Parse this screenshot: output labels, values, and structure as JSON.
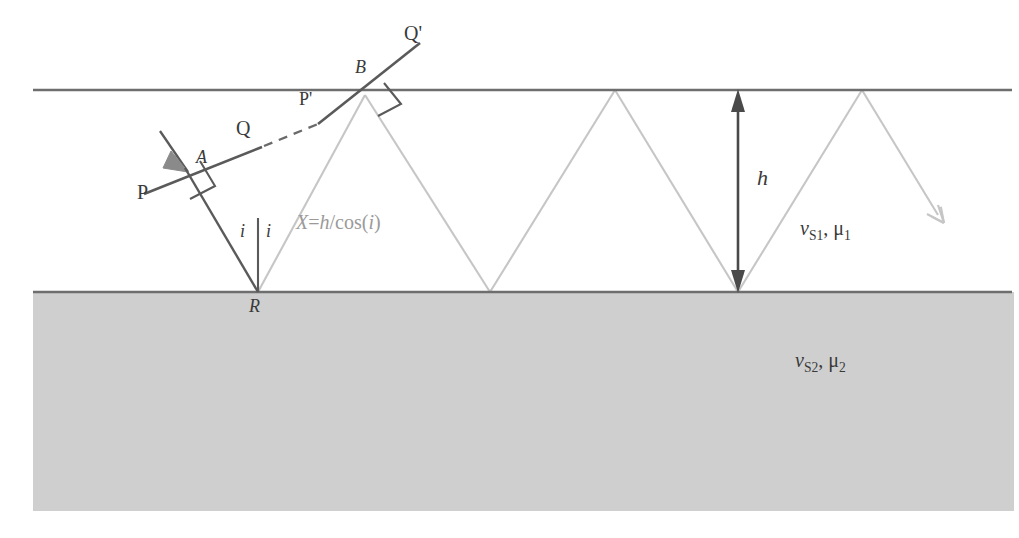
{
  "figure": {
    "colors": {
      "boundary_line": "#6e6e6e",
      "halfspace_fill": "#cfcfcf",
      "wavefront_dark": "#5a5a5a",
      "ray_light": "#c8c8c8",
      "dimension_arrow": "#4a4a4a",
      "text_dark": "#3a3a3a",
      "text_gray": "#9a9a9a",
      "background": "#ffffff"
    },
    "geometry": {
      "top_boundary_y": 90,
      "bottom_boundary_y": 292,
      "left_edge_x": 33,
      "right_edge_x": 1014,
      "halfspace_bottom_y": 511,
      "layer_thickness_px": 202,
      "point_A": [
        185,
        168
      ],
      "point_B": [
        365,
        95
      ],
      "point_R": [
        258,
        292
      ],
      "bounce_points_top": [
        365,
        615,
        862
      ],
      "bounce_points_bottom": [
        258,
        490,
        738
      ],
      "h_arrow_x": 738,
      "final_arrow_tip": [
        942,
        222
      ]
    }
  },
  "labels": {
    "wavefront_P": "P",
    "wavefront_Q": "Q",
    "wavefront_P_prime": "P'",
    "wavefront_Q_prime": "Q'",
    "point_A": "A",
    "point_B": "B",
    "point_R": "R",
    "angle_left": "i",
    "angle_right": "i",
    "path_length": {
      "lhs": "X",
      "equals": "=",
      "numerator": "h",
      "slash": "/",
      "function": "cos",
      "open_paren": "(",
      "arg": "i",
      "close_paren": ")",
      "full": "X=h/cos(i)"
    },
    "layer_thickness": "h",
    "upper_medium": {
      "velocity_symbol": "v",
      "velocity_sub": "S1",
      "separator": ", ",
      "density_symbol": "μ",
      "density_sub": "1",
      "full": "vS1, μ1"
    },
    "lower_medium": {
      "velocity_symbol": "v",
      "velocity_sub": "S2",
      "separator": ", ",
      "density_symbol": "μ",
      "density_sub": "2",
      "full": "vS2, μ2"
    }
  },
  "icons": {
    "incident_arrowhead": "arrow-down-right-icon",
    "exit_arrowhead": "arrow-down-right-light-icon",
    "thickness_arrow": "double-headed-vertical-arrow-icon",
    "right_angle_A": "right-angle-marker-icon",
    "right_angle_B": "right-angle-marker-icon"
  }
}
